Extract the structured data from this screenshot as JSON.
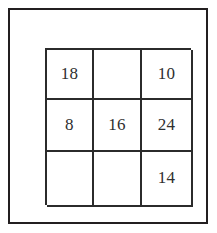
{
  "figure": {
    "kind": "number-grid-puzzle",
    "frame": {
      "name": "outer-frame",
      "border_color": "#231f20"
    },
    "grid": {
      "rows": 3,
      "columns": 3,
      "line_color": "#2b2b2b",
      "background": "#ffffff",
      "text_color": "#2f2f2f"
    }
  },
  "cells": [
    {
      "row": 1,
      "col": 1,
      "value": "18"
    },
    {
      "row": 1,
      "col": 2,
      "value": ""
    },
    {
      "row": 1,
      "col": 3,
      "value": "10"
    },
    {
      "row": 2,
      "col": 1,
      "value": "8"
    },
    {
      "row": 2,
      "col": 2,
      "value": "16"
    },
    {
      "row": 2,
      "col": 3,
      "value": "24"
    },
    {
      "row": 3,
      "col": 1,
      "value": ""
    },
    {
      "row": 3,
      "col": 2,
      "value": ""
    },
    {
      "row": 3,
      "col": 3,
      "value": "14"
    }
  ],
  "chart_data": {
    "type": "table",
    "title": "",
    "xlabel": "",
    "ylabel": "",
    "categories": [
      "column 1",
      "column 2",
      "column 3"
    ],
    "row_labels": [
      "row 1",
      "row 2",
      "row 3"
    ],
    "values": [
      [
        "18",
        "",
        "10"
      ],
      [
        "8",
        "16",
        "24"
      ],
      [
        "",
        "",
        "14"
      ]
    ],
    "filled_values": [
      18,
      10,
      8,
      16,
      24,
      14
    ],
    "empty_cell_count": 3,
    "grid": true,
    "legend": "none"
  }
}
